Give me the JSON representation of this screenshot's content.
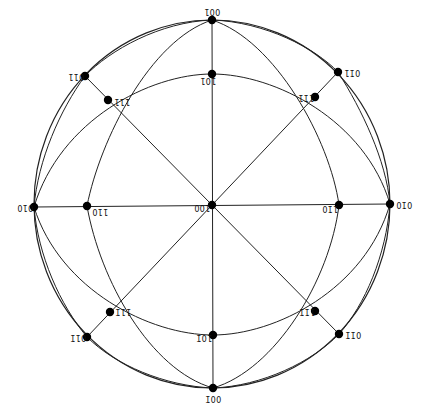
{
  "diagram": {
    "type": "stereographic-projection",
    "colors": {
      "line": "#222222",
      "pole": "#000000",
      "background": "#ffffff"
    },
    "poles": [
      {
        "id": "p001",
        "label": "001",
        "x": 212,
        "y": 20,
        "lx": 204,
        "ly": 7,
        "rot": "flip"
      },
      {
        "id": "p101",
        "label": "101",
        "x": 212,
        "y": 74,
        "lx": 200,
        "ly": 76,
        "rot": "flip"
      },
      {
        "id": "p011",
        "label": "011",
        "x": 85,
        "y": 76,
        "lx": 68,
        "ly": 72,
        "rot": "flip"
      },
      {
        "id": "p111",
        "label": "111",
        "x": 108,
        "y": 100,
        "lx": 114,
        "ly": 97,
        "rot": "flip"
      },
      {
        "id": "p0m11",
        "label": "01̄1",
        "x": 338,
        "y": 72,
        "lx": 344,
        "ly": 68,
        "rot": "flip"
      },
      {
        "id": "p1m11",
        "label": "11̄1",
        "x": 315,
        "y": 97,
        "lx": 298,
        "ly": 93,
        "rot": "flip"
      },
      {
        "id": "p010",
        "label": "010",
        "x": 34,
        "y": 207,
        "lx": 17,
        "ly": 203,
        "rot": "flip"
      },
      {
        "id": "p110",
        "label": "110",
        "x": 87,
        "y": 206,
        "lx": 92,
        "ly": 207,
        "rot": "flip"
      },
      {
        "id": "p100",
        "label": "100",
        "x": 212,
        "y": 205,
        "lx": 194,
        "ly": 203,
        "rot": "flip"
      },
      {
        "id": "p1m10",
        "label": "11̄0",
        "x": 339,
        "y": 205,
        "lx": 322,
        "ly": 204,
        "rot": "flip"
      },
      {
        "id": "p0m10",
        "label": "01̄0",
        "x": 390,
        "y": 204,
        "lx": 396,
        "ly": 200,
        "rot": "flip"
      },
      {
        "id": "p11m1",
        "label": "111̄",
        "x": 110,
        "y": 312,
        "lx": 115,
        "ly": 307,
        "rot": "flip"
      },
      {
        "id": "p01m1",
        "label": "011̄",
        "x": 87,
        "y": 337,
        "lx": 70,
        "ly": 333,
        "rot": "flip"
      },
      {
        "id": "p10m1",
        "label": "101̄",
        "x": 213,
        "y": 335,
        "lx": 196,
        "ly": 333,
        "rot": "flip"
      },
      {
        "id": "p00m1",
        "label": "001̄",
        "x": 213,
        "y": 388,
        "lx": 205,
        "ly": 394,
        "rot": "flip"
      },
      {
        "id": "p1m1m1",
        "label": "11̄1̄",
        "x": 315,
        "y": 311,
        "lx": 299,
        "ly": 307,
        "rot": "flip"
      },
      {
        "id": "p0m1m1",
        "label": "01̄1̄",
        "x": 339,
        "y": 334,
        "lx": 345,
        "ly": 330,
        "rot": "flip"
      }
    ],
    "straight_lines": [
      [
        212,
        20,
        213,
        388
      ],
      [
        34,
        207,
        390,
        204
      ],
      [
        85,
        76,
        339,
        334
      ],
      [
        338,
        72,
        87,
        337
      ]
    ],
    "primitive": {
      "cx": 212,
      "cy": 204,
      "rx": 178,
      "ry": 184
    },
    "great_circle_arcs": [
      "M212,20 C150,40 100,140 87,206 C100,280 150,370 213,388",
      "M212,20 C275,40 330,140 339,205 C330,280 275,370 213,388",
      "M34,207 C60,120 150,74 212,74 C275,74 365,120 390,204",
      "M34,207 C60,290 150,335 213,335 C275,335 365,290 390,204",
      "M212,20 C160,22 110,50 85,76 C60,110 38,160 34,207",
      "M212,20 C265,22 315,48 338,72 C362,110 386,160 390,204",
      "M34,207 C38,255 60,305 87,337 C115,365 165,386 213,388",
      "M390,204 C386,255 365,305 339,334 C312,362 262,386 213,388"
    ]
  }
}
